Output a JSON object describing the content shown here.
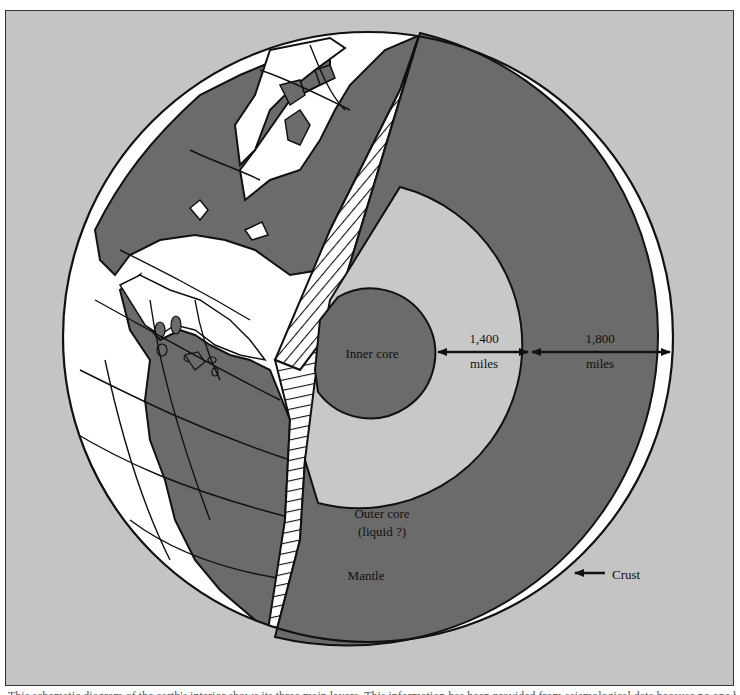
{
  "figure": {
    "labels": {
      "inner_core": "Inner core",
      "outer_core_line1": "Outer core",
      "outer_core_line2": "(liquid ?)",
      "mantle": "Mantle",
      "crust": "Crust"
    },
    "measurements": [
      {
        "value": "1,400",
        "unit": "miles",
        "spans": "outer core thickness"
      },
      {
        "value": "1,800",
        "unit": "miles",
        "spans": "mantle thickness"
      }
    ],
    "colors": {
      "background": "#c4c4c4",
      "mantle": "#6b6b6b",
      "inner_core": "#6b6b6b",
      "outer_core": "#c8c8c8",
      "land": "#6b6b6b",
      "ocean": "#ffffff",
      "outline": "#111111"
    }
  },
  "caption": {
    "text": "This schematic diagram of the earth's interior shows its three main layers. This information has been provided from seismological data because no one has ever seen them"
  }
}
